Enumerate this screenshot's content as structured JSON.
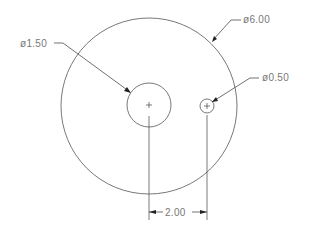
{
  "drawing": {
    "title": "Circle plate with two holes",
    "units_precision": 2,
    "line_color": "#555555",
    "text_color": "#777777",
    "features": [
      {
        "id": "outer",
        "type": "circle",
        "diameter_label": "ø6.00",
        "cx": 149,
        "cy": 106,
        "r": 88
      },
      {
        "id": "center-hole",
        "type": "circle",
        "diameter_label": "ø1.50",
        "cx": 149,
        "cy": 105,
        "r": 22
      },
      {
        "id": "small-hole",
        "type": "circle",
        "diameter_label": "ø0.50",
        "cx": 207,
        "cy": 106,
        "r": 7
      }
    ],
    "dimensions": {
      "outer_diameter": "ø6.00",
      "center_hole_diameter": "ø1.50",
      "small_hole_diameter": "ø0.50",
      "hole_spacing": "2.00"
    }
  }
}
